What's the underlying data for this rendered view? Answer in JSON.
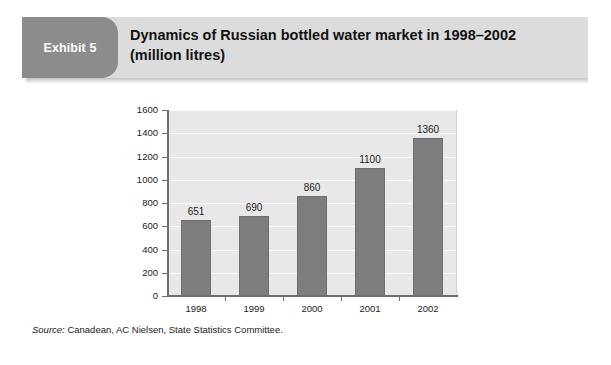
{
  "exhibit": {
    "badge_label": "Exhibit 5",
    "title_line1": "Dynamics of Russian bottled water market in 1998–2002",
    "title_line2": "(million litres)",
    "source_label": "Source:",
    "source_text": " Canadean, AC Nielsen, State Statistics Committee."
  },
  "colors": {
    "badge_bg": "#8c8c8c",
    "header_bg": "#dcdcdc",
    "bar_fill": "#7e7e7e",
    "plot_bg": "#e8e8e8",
    "axis": "#6e6e6e",
    "gridline": "#fafafa",
    "card_bg": "#ffffff"
  },
  "chart_data": {
    "type": "bar",
    "title": "Dynamics of Russian bottled water market in 1998–2002 (million litres)",
    "xlabel": "",
    "ylabel": "",
    "categories": [
      "1998",
      "1999",
      "2000",
      "2001",
      "2002"
    ],
    "values": [
      651,
      690,
      860,
      1100,
      1360
    ],
    "data_labels": [
      "651",
      "690",
      "860",
      "1100",
      "1360"
    ],
    "ylim": [
      0,
      1600
    ],
    "ytick_values": [
      0,
      200,
      400,
      600,
      800,
      1000,
      1200,
      1400,
      1600
    ],
    "ytick_labels": [
      "0",
      "200",
      "400",
      "600",
      "800",
      "1000",
      "1200",
      "1400",
      "1600"
    ],
    "grid": true,
    "legend": false,
    "series": [
      {
        "name": "Bottled water market volume",
        "values": [
          651,
          690,
          860,
          1100,
          1360
        ]
      }
    ]
  }
}
